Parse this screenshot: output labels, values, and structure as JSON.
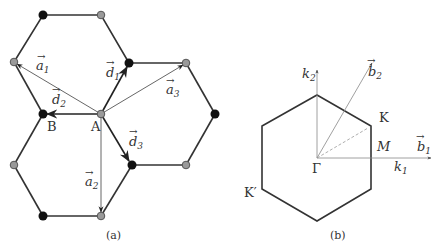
{
  "panel_a": {
    "caption": "(a)",
    "site_labels": {
      "A": "A",
      "B": "B"
    },
    "vectors": {
      "a1": {
        "symbol": "a",
        "sub": "1"
      },
      "a2": {
        "symbol": "a",
        "sub": "2"
      },
      "a3": {
        "symbol": "a",
        "sub": "3"
      },
      "d1": {
        "symbol": "d",
        "sub": "1"
      },
      "d2": {
        "symbol": "d",
        "sub": "2"
      },
      "d3": {
        "symbol": "d",
        "sub": "3"
      }
    },
    "colors": {
      "black_site": "#111111",
      "gray_site": "#9a9a9a",
      "bond": "#333333"
    }
  },
  "panel_b": {
    "caption": "(b)",
    "points": {
      "gamma": "Γ",
      "K": "K",
      "K_prime": "K′",
      "M": "M"
    },
    "axes": {
      "k1": {
        "symbol": "k",
        "sub": "1"
      },
      "k2": {
        "symbol": "k",
        "sub": "2"
      },
      "b1": {
        "symbol": "b",
        "sub": "1"
      },
      "b2": {
        "symbol": "b",
        "sub": "2"
      }
    }
  }
}
